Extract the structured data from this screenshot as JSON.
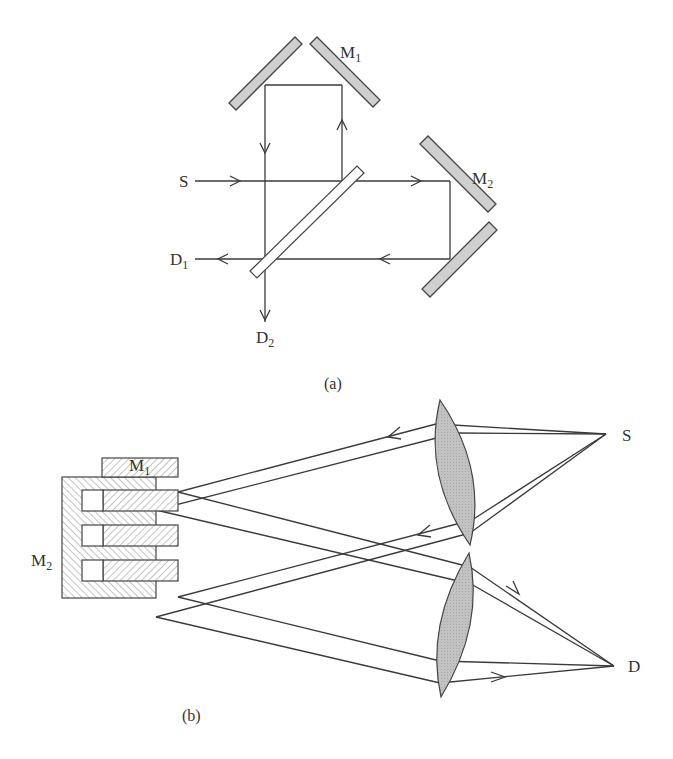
{
  "figure": {
    "panel_a": {
      "caption": "(a)",
      "labels": {
        "source": "S",
        "mirror_1_main": "M",
        "mirror_1_sub": "1",
        "mirror_2_main": "M",
        "mirror_2_sub": "2",
        "detector_1_main": "D",
        "detector_1_sub": "1",
        "detector_2_main": "D",
        "detector_2_sub": "2"
      },
      "components": [
        "source S",
        "beam splitter",
        "roof mirror M1",
        "roof mirror M2",
        "detector D1",
        "detector D2"
      ],
      "colors": {
        "mirror_fill": "#cfcfcf",
        "line": "#3a3a3a"
      }
    },
    "panel_b": {
      "caption": "(b)",
      "labels": {
        "source": "S",
        "detector": "D",
        "mirror_1_main": "M",
        "mirror_1_sub": "1",
        "mirror_2_main": "M",
        "mirror_2_sub": "2"
      },
      "components": [
        "lens (upper)",
        "lens (lower)",
        "stepped mirror M1",
        "comb mirror M2",
        "source S",
        "detector D"
      ],
      "colors": {
        "lens_fill": "#bdbdbd",
        "hatch": "#888888"
      }
    }
  }
}
